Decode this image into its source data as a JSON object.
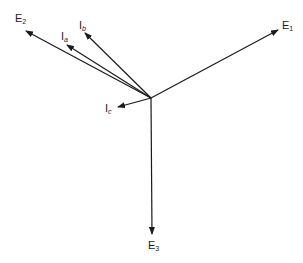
{
  "diagram": {
    "type": "phasor-diagram",
    "origin": {
      "x": 151,
      "y": 98
    },
    "vectors": [
      {
        "id": "E1",
        "name": "E",
        "sub": "1",
        "tip": {
          "x": 278,
          "y": 30
        },
        "label_pos": {
          "x": 282,
          "y": 20
        }
      },
      {
        "id": "E2",
        "name": "E",
        "sub": "2",
        "tip": {
          "x": 26,
          "y": 31
        },
        "label_pos": {
          "x": 15,
          "y": 13
        }
      },
      {
        "id": "E3",
        "name": "E",
        "sub": "3",
        "tip": {
          "x": 152,
          "y": 234
        },
        "label_pos": {
          "x": 148,
          "y": 240
        }
      },
      {
        "id": "Ia",
        "name": "I",
        "sub": "a",
        "tip": {
          "x": 67,
          "y": 45
        },
        "label_pos": {
          "x": 61,
          "y": 31
        }
      },
      {
        "id": "Ib",
        "name": "I",
        "sub": "b",
        "tip": {
          "x": 85,
          "y": 33
        },
        "label_pos": {
          "x": 79,
          "y": 20
        }
      },
      {
        "id": "Ic",
        "name": "I",
        "sub": "c",
        "tip": {
          "x": 118,
          "y": 107
        },
        "label_pos": {
          "x": 105,
          "y": 103
        }
      }
    ],
    "colors": {
      "ink": "#1a1a1a",
      "background": "#ffffff"
    }
  }
}
